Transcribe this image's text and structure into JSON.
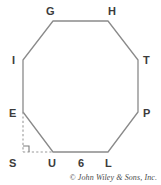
{
  "figure": {
    "type": "geometry-diagram",
    "shape_name": "regular-octagon",
    "background_color": "#ffffff",
    "stroke_color": "#8a8a8a",
    "dash_color": "#9a9a9a",
    "label_color": "#3b3b3b",
    "vertices": [
      {
        "id": "G",
        "label": "G",
        "x": 53,
        "y": 21,
        "label_x": 46,
        "label_y": 6
      },
      {
        "id": "H",
        "label": "H",
        "x": 108,
        "y": 21,
        "label_x": 108,
        "label_y": 6
      },
      {
        "id": "T",
        "label": "T",
        "x": 138,
        "y": 60,
        "label_x": 143,
        "label_y": 55
      },
      {
        "id": "P",
        "label": "P",
        "x": 138,
        "y": 112,
        "label_x": 143,
        "label_y": 108
      },
      {
        "id": "L",
        "label": "L",
        "x": 108,
        "y": 152,
        "label_x": 105,
        "label_y": 158
      },
      {
        "id": "U",
        "label": "U",
        "x": 53,
        "y": 152,
        "label_x": 48,
        "label_y": 158
      },
      {
        "id": "E",
        "label": "E",
        "x": 23,
        "y": 112,
        "label_x": 9,
        "label_y": 108
      },
      {
        "id": "I",
        "label": "I",
        "x": 23,
        "y": 60,
        "label_x": 12,
        "label_y": 55
      }
    ],
    "auxiliary_point": {
      "id": "S",
      "label": "S",
      "x": 23,
      "y": 152,
      "label_x": 9,
      "label_y": 158
    },
    "dashed_segments": [
      {
        "name": "E-to-S",
        "x1": 23,
        "y1": 112,
        "x2": 23,
        "y2": 152
      },
      {
        "name": "S-to-U",
        "x1": 23,
        "y1": 152,
        "x2": 53,
        "y2": 152
      }
    ],
    "right_angle_marker": {
      "at": "S",
      "size": 6
    },
    "side_measures": [
      {
        "name": "UL-length",
        "value": "6",
        "label_x": 78,
        "label_y": 158
      }
    ]
  },
  "credit": {
    "text": "© John Wiley & Sons, Inc."
  }
}
